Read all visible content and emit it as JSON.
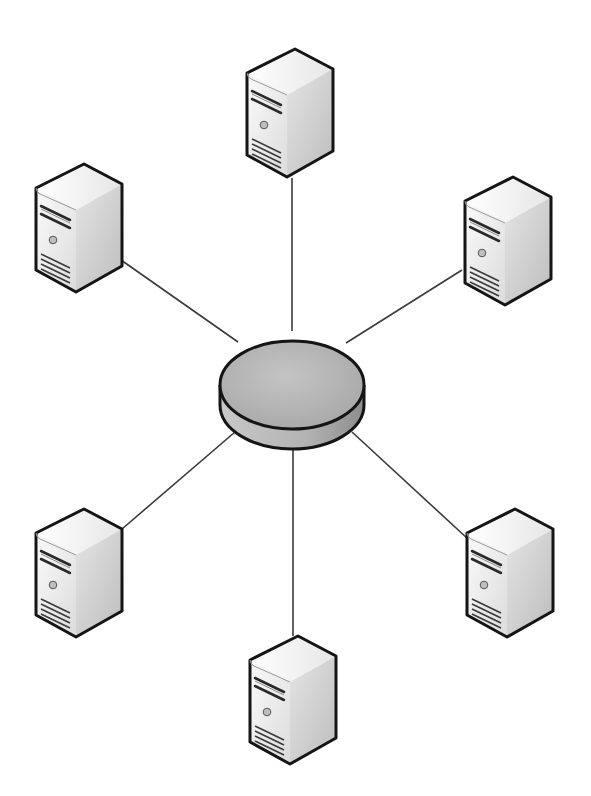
{
  "diagram": {
    "type": "star-topology",
    "hub": {
      "name": "central-hub",
      "shape": "cylinder-disk",
      "cx": 292,
      "cy": 385,
      "rx": 72,
      "ry": 44,
      "depth": 20,
      "top_color": "#b9b9b9",
      "side_color": "#a9a9a9"
    },
    "nodes": [
      {
        "id": "server-top",
        "icon": "server-tower-icon",
        "x": 243,
        "y": 47,
        "link": [
          292,
          178,
          292,
          331
        ]
      },
      {
        "id": "server-upper-left",
        "icon": "server-tower-icon",
        "x": 33,
        "y": 162,
        "link": [
          121,
          260,
          238,
          342
        ]
      },
      {
        "id": "server-upper-right",
        "icon": "server-tower-icon",
        "x": 462,
        "y": 175,
        "link": [
          462,
          270,
          346,
          343
        ]
      },
      {
        "id": "server-lower-left",
        "icon": "server-tower-icon",
        "x": 33,
        "y": 507,
        "link": [
          122,
          529,
          235,
          432
        ]
      },
      {
        "id": "server-lower-right",
        "icon": "server-tower-icon",
        "x": 463,
        "y": 507,
        "link": [
          468,
          539,
          352,
          432
        ]
      },
      {
        "id": "server-bottom",
        "icon": "server-tower-icon",
        "x": 246,
        "y": 634,
        "link": [
          293,
          636,
          293,
          450
        ]
      }
    ],
    "colors": {
      "background": "#ffffff",
      "outline": "#151515",
      "link": "#3a3a3a",
      "server_front": "#efefef",
      "server_top": "#f6f6f6",
      "server_side": "#d0d0d0"
    }
  }
}
